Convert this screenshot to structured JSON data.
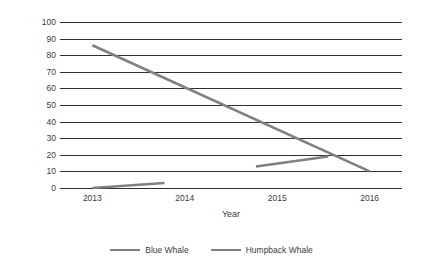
{
  "chart_data": {
    "type": "line",
    "title": "",
    "xlabel": "Year",
    "ylabel": "Number of Individuals",
    "x": [
      2013,
      2014,
      2015,
      2016
    ],
    "xlim": [
      2012.65,
      2016.35
    ],
    "ylim": [
      0,
      100
    ],
    "ytick_values": [
      0,
      10,
      20,
      30,
      40,
      50,
      60,
      70,
      80,
      90,
      100
    ],
    "ytick_labels": [
      "0",
      "10",
      "20",
      "30",
      "40",
      "50",
      "60",
      "70",
      "80",
      "90",
      "100"
    ],
    "xtick_labels": [
      "2013",
      "2014",
      "2015",
      "2016"
    ],
    "grid": "horizontal",
    "legend_position": "bottom",
    "series": [
      {
        "name": "Blue Whale",
        "color": "#808080",
        "points": [
          {
            "x": 2013.0,
            "y": 86
          },
          {
            "x": 2016.0,
            "y": 10
          }
        ]
      },
      {
        "name": "Humpback Whale",
        "color": "#808080",
        "segments": [
          [
            {
              "x": 2013.0,
              "y": 0
            },
            {
              "x": 2013.78,
              "y": 3
            }
          ],
          [
            {
              "x": 2014.77,
              "y": 13
            },
            {
              "x": 2015.55,
              "y": 19
            }
          ]
        ]
      }
    ]
  },
  "legend": {
    "entries": [
      {
        "label": "Blue Whale"
      },
      {
        "label": "Humpback Whale"
      }
    ]
  },
  "axes": {
    "y_title": "Number of Individuals",
    "x_title": "Year"
  },
  "colors": {
    "series_line": "#808080",
    "gridline": "#2f2f2f",
    "text": "#3b3b3b",
    "background": "#ffffff"
  }
}
